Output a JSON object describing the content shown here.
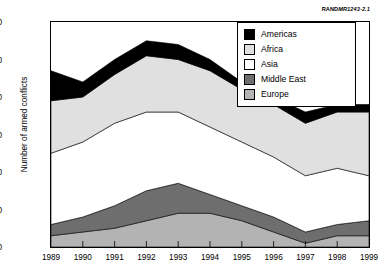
{
  "credit": {
    "brand": "RAND",
    "doc": "MR1243-2.1"
  },
  "axes": {
    "ylabel": "Number of armed conflicts",
    "yticks": [
      0,
      10,
      20,
      30,
      40,
      50,
      60
    ],
    "xticks": [
      "1989",
      "1990",
      "1991",
      "1992",
      "1993",
      "1994",
      "1995",
      "1996",
      "1997",
      "1998",
      "1999"
    ]
  },
  "legend": {
    "items": [
      {
        "label": "Americas",
        "color": "#000000"
      },
      {
        "label": "Africa",
        "color": "#e0e0e0"
      },
      {
        "label": "Asia",
        "color": "#ffffff"
      },
      {
        "label": "Middle East",
        "color": "#6e6e6e"
      },
      {
        "label": "Europe",
        "color": "#b3b3b3"
      }
    ]
  },
  "chart_data": {
    "type": "area",
    "title": "",
    "xlabel": "",
    "ylabel": "Number of armed conflicts",
    "categories": [
      "1989",
      "1990",
      "1991",
      "1992",
      "1993",
      "1994",
      "1995",
      "1996",
      "1997",
      "1998",
      "1999"
    ],
    "ylim": [
      0,
      60
    ],
    "xlim": [
      "1989",
      "1999"
    ],
    "grid": false,
    "stacked": true,
    "stack_order_bottom_to_top": [
      "Europe",
      "Middle East",
      "Asia",
      "Africa",
      "Americas"
    ],
    "legend_position": "top-right",
    "series": [
      {
        "name": "Europe",
        "color": "#b3b3b3",
        "values": [
          3,
          4,
          5,
          7,
          9,
          9,
          7,
          4,
          1,
          3,
          3
        ]
      },
      {
        "name": "Middle East",
        "color": "#6e6e6e",
        "values": [
          3,
          4,
          6,
          8,
          8,
          5,
          4,
          4,
          3,
          3,
          4
        ]
      },
      {
        "name": "Asia",
        "color": "#ffffff",
        "values": [
          19,
          20,
          22,
          21,
          19,
          18,
          17,
          16,
          15,
          15,
          12
        ]
      },
      {
        "name": "Africa",
        "color": "#e0e0e0",
        "values": [
          14,
          12,
          13,
          15,
          14,
          15,
          14,
          14,
          14,
          15,
          17
        ]
      },
      {
        "name": "Americas",
        "color": "#000000",
        "values": [
          8,
          4,
          4,
          4,
          4,
          3,
          2,
          2,
          3,
          2,
          2
        ]
      }
    ],
    "totals": [
      47,
      44,
      50,
      55,
      54,
      50,
      44,
      40,
      36,
      38,
      38
    ]
  }
}
